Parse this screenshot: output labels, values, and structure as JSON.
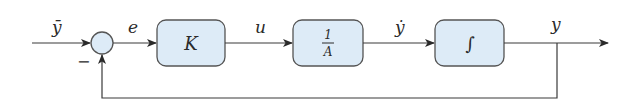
{
  "diagram": {
    "type": "block-diagram",
    "colors": {
      "line": "#3a3a3a",
      "block_fill": "#ddebf7",
      "block_stroke": "#555555",
      "background": "#ffffff"
    },
    "signals": {
      "reference": "ȳ",
      "error": "e",
      "control": "u",
      "rate": "ẏ",
      "output": "y"
    },
    "summing_junction": {
      "sign_feedback": "−"
    },
    "blocks": [
      {
        "id": "gain",
        "label": "K"
      },
      {
        "id": "inverse",
        "numerator": "1",
        "denominator": "A"
      },
      {
        "id": "integrator",
        "label": "∫"
      }
    ]
  }
}
